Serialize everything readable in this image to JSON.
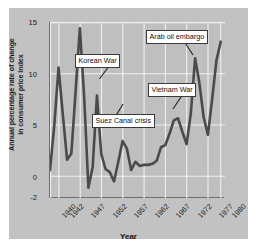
{
  "chart_data": {
    "type": "line",
    "title": "",
    "xlabel": "Year",
    "ylabel": "Annual percentage rate of change in consumer price index",
    "ylabel_line1": "Annual percentage rate of change",
    "ylabel_line2": "in consumer price index",
    "xlim": [
      1940,
      1981
    ],
    "ylim": [
      -2,
      15
    ],
    "yticks": [
      "15",
      "10",
      "5",
      "0",
      "-2"
    ],
    "ytick_values": [
      15,
      10,
      5,
      0,
      -2
    ],
    "xticks": [
      "1940",
      "1942",
      "1947",
      "1952",
      "1957",
      "1962",
      "1967",
      "1972",
      "1977",
      "1980"
    ],
    "xtick_values": [
      1940,
      1942,
      1947,
      1952,
      1957,
      1962,
      1967,
      1972,
      1977,
      1980
    ],
    "grid": true,
    "grid_color": "#f2f2f2",
    "legend": "none",
    "line_color": "#4a4a4a",
    "series": [
      {
        "name": "Annual percentage rate of change in consumer price index",
        "x": [
          1940,
          1941,
          1942,
          1943,
          1944,
          1945,
          1946,
          1947,
          1948,
          1949,
          1950,
          1951,
          1952,
          1953,
          1954,
          1955,
          1956,
          1957,
          1958,
          1959,
          1960,
          1961,
          1962,
          1963,
          1964,
          1965,
          1966,
          1967,
          1968,
          1969,
          1970,
          1971,
          1972,
          1973,
          1974,
          1975,
          1976,
          1977,
          1978,
          1979,
          1980
        ],
        "values": [
          0.7,
          5.0,
          10.6,
          6.1,
          1.7,
          2.3,
          8.3,
          14.4,
          7.8,
          -1.0,
          1.0,
          7.9,
          2.3,
          0.8,
          0.5,
          -0.4,
          1.5,
          3.5,
          2.8,
          0.7,
          1.5,
          1.1,
          1.2,
          1.2,
          1.3,
          1.6,
          2.9,
          3.1,
          4.2,
          5.5,
          5.7,
          4.4,
          3.2,
          6.2,
          11.5,
          9.1,
          5.8,
          4.1,
          7.6,
          11.3,
          13.1
        ]
      }
    ],
    "annotations": [
      {
        "label": "Korean War",
        "year": 1951,
        "value": 7.9
      },
      {
        "label": "Suez Canal crisis",
        "year": 1957,
        "value": 3.5
      },
      {
        "label": "Vietnam War",
        "year": 1969,
        "value": 5.5
      },
      {
        "label": "Arab oil embargo",
        "year": 1974,
        "value": 11.5
      }
    ]
  },
  "callouts": {
    "korean_war": "Korean War",
    "suez_canal_crisis": "Suez Canal crisis",
    "vietnam_war": "Vietnam War",
    "arab_oil_embargo": "Arab oil embargo"
  }
}
